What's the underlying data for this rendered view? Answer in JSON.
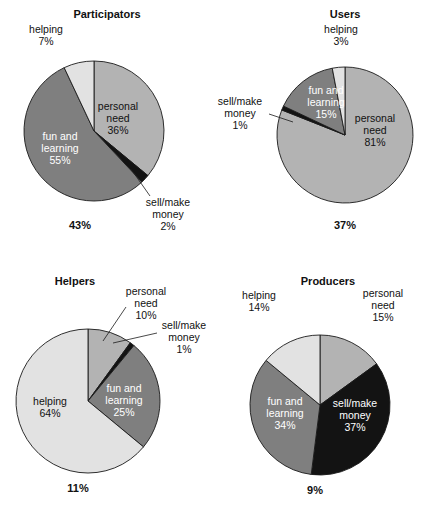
{
  "figure": {
    "background": "#ffffff",
    "palette": {
      "personal_need": "#b3b3b3",
      "sell_make_money": "#131313",
      "fun_and_learning": "#7f7f7f",
      "helping": "#e2e2e2",
      "outline": "#1a1a1a",
      "text": "#111111",
      "text_on_dark": "#ffffff"
    }
  },
  "chart_data": [
    {
      "type": "pie",
      "title": "Participators",
      "total_label": "43%",
      "categories": [
        "personal need",
        "sell/make money",
        "fun and learning",
        "helping"
      ],
      "values": [
        36,
        2,
        55,
        7
      ],
      "labels": [
        {
          "name": "personal need",
          "line1": "personal",
          "line2": "need",
          "line3": "36%"
        },
        {
          "name": "sell/make money",
          "line1": "sell/make",
          "line2": "money",
          "line3": "2%"
        },
        {
          "name": "fun and learning",
          "line1": "fun and",
          "line2": "learning",
          "line3": "55%"
        },
        {
          "name": "helping",
          "line1": "helping",
          "line2": "7%",
          "line3": ""
        }
      ]
    },
    {
      "type": "pie",
      "title": "Users",
      "total_label": "37%",
      "categories": [
        "personal need",
        "sell/make money",
        "fun and learning",
        "helping"
      ],
      "values": [
        81,
        1,
        15,
        3
      ],
      "labels": [
        {
          "name": "personal need",
          "line1": "personal",
          "line2": "need",
          "line3": "81%"
        },
        {
          "name": "sell/make money",
          "line1": "sell/make",
          "line2": "money",
          "line3": "1%"
        },
        {
          "name": "fun and learning",
          "line1": "fun and",
          "line2": "learning",
          "line3": "15%"
        },
        {
          "name": "helping",
          "line1": "helping",
          "line2": "3%",
          "line3": ""
        }
      ]
    },
    {
      "type": "pie",
      "title": "Helpers",
      "total_label": "11%",
      "categories": [
        "personal need",
        "sell/make money",
        "fun and learning",
        "helping"
      ],
      "values": [
        10,
        1,
        25,
        64
      ],
      "labels": [
        {
          "name": "personal need",
          "line1": "personal",
          "line2": "need",
          "line3": "10%"
        },
        {
          "name": "sell/make money",
          "line1": "sell/make",
          "line2": "money",
          "line3": "1%"
        },
        {
          "name": "fun and learning",
          "line1": "fun and",
          "line2": "learning",
          "line3": "25%"
        },
        {
          "name": "helping",
          "line1": "helping",
          "line2": "64%",
          "line3": ""
        }
      ]
    },
    {
      "type": "pie",
      "title": "Producers",
      "total_label": "9%",
      "categories": [
        "personal need",
        "sell/make money",
        "fun and learning",
        "helping"
      ],
      "values": [
        15,
        37,
        34,
        14
      ],
      "labels": [
        {
          "name": "personal need",
          "line1": "personal",
          "line2": "need",
          "line3": "15%"
        },
        {
          "name": "sell/make money",
          "line1": "sell/make",
          "line2": "money",
          "line3": "37%"
        },
        {
          "name": "fun and learning",
          "line1": "fun and",
          "line2": "learning",
          "line3": "34%"
        },
        {
          "name": "helping",
          "line1": "helping",
          "line2": "14%",
          "line3": ""
        }
      ]
    }
  ]
}
